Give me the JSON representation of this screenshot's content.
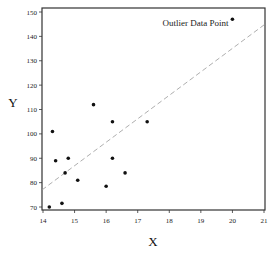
{
  "chart_data": {
    "type": "scatter",
    "title": "",
    "xlabel": "X",
    "ylabel": "Y",
    "xlim": [
      14,
      21
    ],
    "ylim": [
      70,
      150
    ],
    "x_ticks": [
      14,
      15,
      16,
      17,
      18,
      19,
      20,
      21
    ],
    "y_ticks": [
      70,
      80,
      90,
      100,
      110,
      120,
      130,
      140,
      150
    ],
    "grid": false,
    "legend": null,
    "series": [
      {
        "name": "data",
        "points": [
          {
            "x": 14.2,
            "y": 70
          },
          {
            "x": 14.3,
            "y": 101
          },
          {
            "x": 14.4,
            "y": 89
          },
          {
            "x": 14.6,
            "y": 71.5
          },
          {
            "x": 14.7,
            "y": 84
          },
          {
            "x": 14.8,
            "y": 90
          },
          {
            "x": 15.1,
            "y": 81
          },
          {
            "x": 15.6,
            "y": 112
          },
          {
            "x": 16.0,
            "y": 78.5
          },
          {
            "x": 16.2,
            "y": 90
          },
          {
            "x": 16.2,
            "y": 105
          },
          {
            "x": 16.6,
            "y": 84
          },
          {
            "x": 17.3,
            "y": 105
          },
          {
            "x": 20.0,
            "y": 147
          }
        ]
      }
    ],
    "fit_line": {
      "style": "dashed",
      "x0": 14,
      "y0": 77,
      "x1": 21,
      "y1": 145
    },
    "annotations": [
      {
        "text": "Outlier Data Point",
        "x": 20.0,
        "y": 147
      }
    ]
  }
}
